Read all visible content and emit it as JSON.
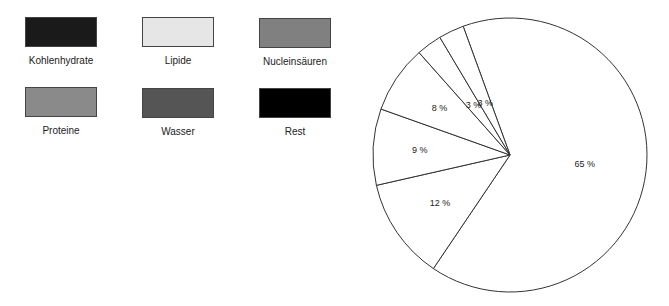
{
  "legend": {
    "items": [
      {
        "label": "Kohlenhydrate",
        "color": "#1a1a1a"
      },
      {
        "label": "Lipide",
        "color": "#e6e6e6"
      },
      {
        "label": "Nucleinsäuren",
        "color": "#808080"
      },
      {
        "label": "Proteine",
        "color": "#8a8a8a"
      },
      {
        "label": "Wasser",
        "color": "#555555"
      },
      {
        "label": "Rest",
        "color": "#000000"
      }
    ]
  },
  "chart_data": {
    "type": "pie",
    "title": "",
    "categories": [
      "Wasser",
      "Proteine",
      "Lipide",
      "Kohlenhydrate",
      "Nucleinsäuren",
      "Rest"
    ],
    "values": [
      65,
      12,
      9,
      8,
      3,
      3
    ],
    "labels": [
      "65 %",
      "12 %",
      "9 %",
      "8 %",
      "3 %",
      "3 %"
    ],
    "legend_position": "left",
    "note": "Slices drawn as white outlines; legend colors not applied to slices in the image"
  }
}
